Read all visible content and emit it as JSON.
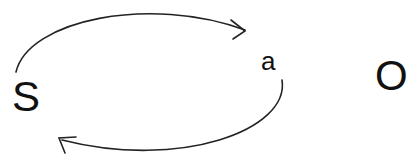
{
  "diagram": {
    "nodes": [
      {
        "id": "S",
        "label": "S"
      },
      {
        "id": "a",
        "label": "a"
      },
      {
        "id": "O",
        "label": "O"
      }
    ],
    "edges": [
      {
        "from": "S",
        "to": "a",
        "path": "top arc",
        "color": "#222222"
      },
      {
        "from": "a",
        "to": "S",
        "path": "bottom arc",
        "color": "#222222"
      }
    ]
  }
}
